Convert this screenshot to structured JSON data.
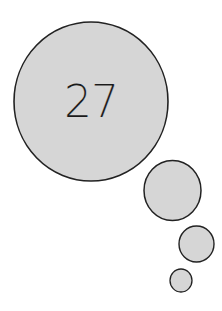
{
  "thought_bubble": {
    "label": "27",
    "fill_color": "#d6d6d6",
    "stroke_color": "#222222",
    "circles": [
      {
        "name": "main-bubble",
        "cx": 91,
        "cy": 101.5,
        "rx": 77,
        "ry": 79.5
      },
      {
        "name": "medium-bubble",
        "cx": 172.5,
        "cy": 190.5,
        "rx": 28.5,
        "ry": 30
      },
      {
        "name": "small-bubble",
        "cx": 196.5,
        "cy": 244,
        "rx": 17.5,
        "ry": 18
      },
      {
        "name": "tiny-bubble",
        "cx": 181,
        "cy": 280.5,
        "rx": 11,
        "ry": 11.5
      }
    ]
  }
}
